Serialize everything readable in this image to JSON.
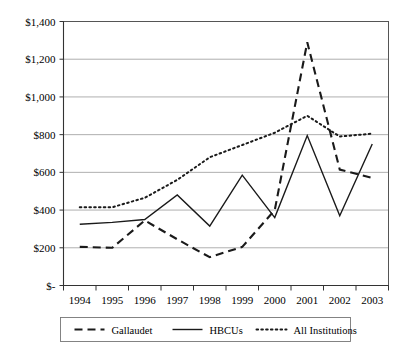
{
  "chart_data": {
    "type": "line",
    "title": "",
    "subtitle": "",
    "xlabel": "",
    "ylabel": "",
    "x": [
      1994,
      1995,
      1996,
      1997,
      1998,
      1999,
      2000,
      2001,
      2002,
      2003
    ],
    "categories": [
      "1994",
      "1995",
      "1996",
      "1997",
      "1998",
      "1999",
      "2000",
      "2001",
      "2002",
      "2003"
    ],
    "xlim": [
      1994,
      2003
    ],
    "ylim": [
      0,
      1400
    ],
    "y_ticks": [
      0,
      200,
      400,
      600,
      800,
      1000,
      1200,
      1400
    ],
    "y_tick_labels": [
      "$-",
      "$200",
      "$400",
      "$600",
      "$800",
      "$1,000",
      "$1,200",
      "$1,400"
    ],
    "x_tick_labels": [
      "1994",
      "1995",
      "1996",
      "1997",
      "1998",
      "1999",
      "2000",
      "2001",
      "2002",
      "2003"
    ],
    "grid": true,
    "grid_axis": "y",
    "legend_position": "bottom",
    "series": [
      {
        "name": "Gallaudet",
        "style": "dashed",
        "color": "#1a1a1a",
        "values": [
          205,
          200,
          345,
          245,
          150,
          205,
          400,
          1290,
          615,
          570
        ]
      },
      {
        "name": "HBCUs",
        "style": "solid",
        "color": "#1a1a1a",
        "values": [
          325,
          335,
          350,
          480,
          315,
          585,
          360,
          795,
          370,
          750
        ]
      },
      {
        "name": "All Institutions",
        "style": "dotted",
        "color": "#1a1a1a",
        "values": [
          415,
          415,
          465,
          560,
          680,
          745,
          810,
          900,
          790,
          805
        ]
      }
    ]
  },
  "legend": {
    "entries": [
      {
        "label": "Gallaudet",
        "style": "dashed"
      },
      {
        "label": "HBCUs",
        "style": "solid"
      },
      {
        "label": "All Institutions",
        "style": "dotted"
      }
    ]
  }
}
